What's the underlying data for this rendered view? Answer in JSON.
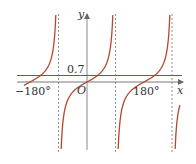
{
  "chart_data": {
    "type": "line",
    "title": "",
    "xlabel": "x",
    "ylabel": "y",
    "origin_label": "O",
    "x_ticks": [
      {
        "value": -180,
        "label": "−180°"
      },
      {
        "value": 180,
        "label": "180°"
      }
    ],
    "asymptotes_deg": [
      -90,
      90,
      270
    ],
    "series": [
      {
        "name": "y = tan x",
        "color": "#b5472f",
        "domain_deg": [
          -200,
          300
        ]
      },
      {
        "name": "y = 0.7",
        "color": "#5a5a8c",
        "value": 0.7
      }
    ],
    "hline_label": "0.7",
    "xlim_deg": [
      -200,
      300
    ],
    "grid": false
  },
  "colors": {
    "curve": "#b5472f",
    "hline": "#5a5a8c",
    "axis": "#888888",
    "asymptote": "#777777"
  }
}
